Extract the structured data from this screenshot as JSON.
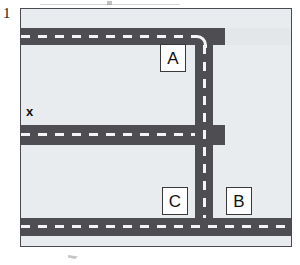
{
  "figure": {
    "number": "1",
    "caption": ""
  },
  "map": {
    "background_color": "#e3e7ea",
    "border_color": "#4a4a52",
    "block_color": "#e8ecef",
    "road_color": "#4d4d52",
    "lane_marking_color": "#f4f4f4",
    "frame": {
      "x": 20,
      "y": 8,
      "width": 272,
      "height": 239
    }
  },
  "roads": [
    {
      "id": "road-top-horizontal",
      "orientation": "horizontal",
      "x": 0,
      "y": 19,
      "width": 204,
      "height": 17,
      "dash_offset": 7
    },
    {
      "id": "road-middle-horizontal",
      "orientation": "horizontal",
      "x": 0,
      "y": 116,
      "width": 204,
      "height": 20,
      "dash_offset": 8
    },
    {
      "id": "road-bottom-horizontal",
      "orientation": "horizontal",
      "x": 0,
      "y": 209,
      "width": 272,
      "height": 18,
      "dash_offset": 8
    },
    {
      "id": "road-vertical",
      "orientation": "vertical",
      "x": 174,
      "y": 19,
      "width": 18,
      "height": 208,
      "dash_offset": 7
    }
  ],
  "blocks": [
    {
      "id": "block-upper-left",
      "x": 0,
      "y": 36,
      "width": 174,
      "height": 80
    },
    {
      "id": "block-lower-left",
      "x": 0,
      "y": 136,
      "width": 174,
      "height": 73
    },
    {
      "id": "block-right",
      "x": 192,
      "y": 36,
      "width": 80,
      "height": 173
    },
    {
      "id": "block-top-strip",
      "x": 0,
      "y": 0,
      "width": 272,
      "height": 19
    },
    {
      "id": "block-bottom-strip",
      "x": 0,
      "y": 227,
      "width": 272,
      "height": 12
    }
  ],
  "labels": [
    {
      "id": "label-a",
      "text": "A",
      "x": 139,
      "y": 35,
      "width": 26,
      "height": 28
    },
    {
      "id": "label-c",
      "text": "C",
      "x": 141,
      "y": 178,
      "width": 26,
      "height": 28
    },
    {
      "id": "label-b",
      "text": "B",
      "x": 205,
      "y": 178,
      "width": 26,
      "height": 28
    }
  ],
  "markers": [
    {
      "id": "marker-x",
      "text": "x",
      "x": 5,
      "y": 96
    }
  ]
}
